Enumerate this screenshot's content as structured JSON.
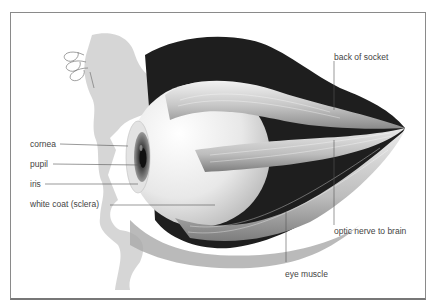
{
  "diagram": {
    "labels": {
      "cornea": "cornea",
      "pupil": "pupil",
      "iris": "iris",
      "sclera": "white coat (sclera)",
      "back_of_socket": "back of socket",
      "optic_nerve": "optic nerve to brain",
      "eye_muscle": "eye muscle"
    }
  }
}
